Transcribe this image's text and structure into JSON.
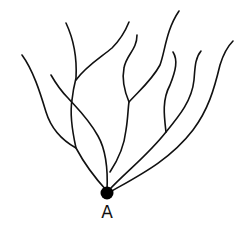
{
  "diagram": {
    "type": "branching-tree",
    "root_label": "A",
    "colors": {
      "stroke": "#111111",
      "node": "#000000",
      "background": "#ffffff"
    },
    "root": {
      "x": 107,
      "y": 193,
      "r": 6.5
    },
    "label_pos": {
      "x": 107,
      "y": 218
    },
    "branches": [
      {
        "id": "far-left",
        "d": "M107,191 C95,178 84,163 76,148 C58,138 50,125 46,112 C40,92 33,70 22,55"
      },
      {
        "id": "left-trunk",
        "d": "M76,148 C72,130 70,112 72,100 C73,90 75,82 76,78 C77,60 74,40 66,23"
      },
      {
        "id": "left-upper",
        "d": "M76,80 C86,66 100,58 112,48 C120,40 125,32 129,22"
      },
      {
        "id": "cross-left",
        "d": "M107,191 C108,170 106,150 98,136 C88,118 75,106 68,98 C60,90 55,82 51,75"
      },
      {
        "id": "center-trunk",
        "d": "M110,172 C118,160 124,148 126,130 C128,118 128,108 129,102 C124,90 122,78 124,68 C126,55 137,50 137,35"
      },
      {
        "id": "center-upper",
        "d": "M129,102 C140,90 152,80 160,65 C165,52 166,30 179,11"
      },
      {
        "id": "right-mid",
        "d": "M109,190 C128,170 148,155 166,132 C164,115 162,100 170,85 C176,70 178,60 173,52"
      },
      {
        "id": "right-mid-2",
        "d": "M166,132 C180,115 192,100 194,80 C195,68 195,58 201,51"
      },
      {
        "id": "far-right",
        "d": "M110,192 C140,175 170,160 193,130 C208,110 214,90 220,65 C224,52 228,46 233,41"
      }
    ]
  }
}
